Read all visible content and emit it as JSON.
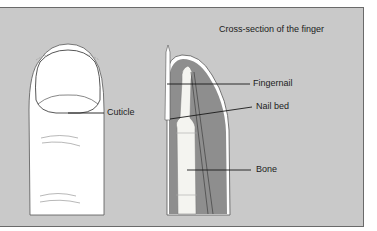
{
  "diagram": {
    "title": "Cross-section of the finger",
    "labels": {
      "cuticle": "Cuticle",
      "fingernail": "Fingernail",
      "nail_bed": "Nail bed",
      "bone": "Bone"
    },
    "colors": {
      "background": "#c9c9c9",
      "tissue": "#8e8e8e",
      "bone": "#f4f4f0",
      "skin": "#ffffff",
      "line": "#1a1a1a"
    }
  }
}
